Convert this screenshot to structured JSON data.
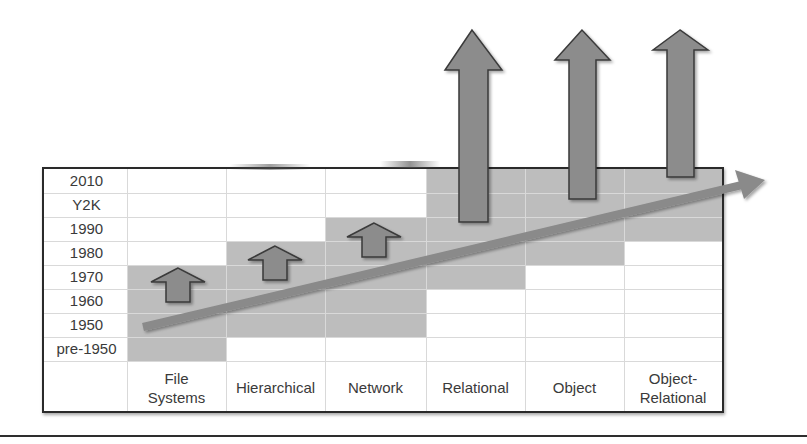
{
  "diagram": {
    "title": "",
    "rows": [
      "2010",
      "Y2K",
      "1990",
      "1980",
      "1970",
      "1960",
      "1950",
      "pre-1950"
    ],
    "columns": [
      {
        "label": "File\nSystems",
        "shade_from_row": "1970",
        "shade_to_row": "pre-1950",
        "arrow": "small"
      },
      {
        "label": "Hierarchical",
        "shade_from_row": "1980",
        "shade_to_row": "1950",
        "arrow": "small"
      },
      {
        "label": "Network",
        "shade_from_row": "1990",
        "shade_to_row": "1950",
        "arrow": "small"
      },
      {
        "label": "Relational",
        "shade_from_row": "2010",
        "shade_to_row": "1960",
        "arrow": "tall"
      },
      {
        "label": "Object",
        "shade_from_row": "2010",
        "shade_to_row": "1970",
        "arrow": "tall"
      },
      {
        "label": "Object-\nRelational",
        "shade_from_row": "2010",
        "shade_to_row": "1990",
        "arrow": "tall"
      }
    ],
    "trend_arrow": {
      "direction": "up-right",
      "meaning": "evolution over time"
    }
  },
  "colors": {
    "shade": "#bdbdbd",
    "arrow_fill": "#8c8c8c",
    "arrow_stroke": "#3a3a3a",
    "trend_arrow": "#8a8a8a",
    "gridline": "#d9d9d9",
    "border": "#2a2a2a",
    "text": "#3a3a3a"
  }
}
